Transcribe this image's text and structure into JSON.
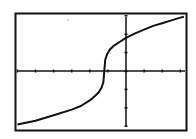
{
  "chart_data": {
    "type": "line",
    "title": "",
    "xlabel": "",
    "ylabel": "",
    "xlim": [
      -6,
      3.2
    ],
    "ylim": [
      -3.1,
      3.2
    ],
    "x_tick_step": 1,
    "y_tick_step": 1,
    "grid": false,
    "legend": false,
    "series": [
      {
        "name": "f(x)",
        "x": [
          -6,
          -5,
          -4,
          -3,
          -2.5,
          -2,
          -1.7,
          -1.5,
          -1.35,
          -1.25,
          -1.2,
          -1.15,
          -1.05,
          -0.9,
          -0.7,
          -0.4,
          0,
          0.5,
          1,
          1.5,
          2,
          2.5,
          3,
          3.2
        ],
        "y": [
          -2.9,
          -2.7,
          -2.4,
          -2.1,
          -1.9,
          -1.6,
          -1.35,
          -1.15,
          -0.9,
          -0.6,
          0,
          0.6,
          0.9,
          1.15,
          1.35,
          1.55,
          1.8,
          2.05,
          2.25,
          2.45,
          2.6,
          2.75,
          2.9,
          2.95
        ]
      }
    ]
  },
  "colors": {
    "background": "#ffffff",
    "ink": "#111111"
  }
}
